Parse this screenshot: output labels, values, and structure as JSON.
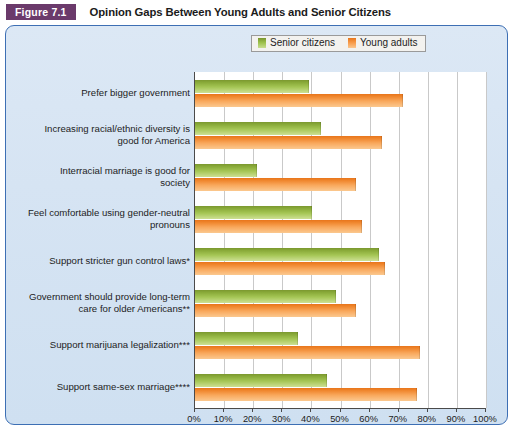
{
  "figure": {
    "tag": "Figure 7.1",
    "title": "Opinion Gaps Between Young Adults and Senior Citizens"
  },
  "legend": {
    "position": "top-center",
    "items": [
      {
        "label": "Senior citizens",
        "color": "#9cc04a",
        "icon": "legend-swatch-senior"
      },
      {
        "label": "Young adults",
        "color": "#f79a48",
        "icon": "legend-swatch-young"
      }
    ]
  },
  "axis": {
    "x_ticks": [
      "0%",
      "10%",
      "20%",
      "30%",
      "40%",
      "50%",
      "60%",
      "70%",
      "80%",
      "90%",
      "100%"
    ],
    "x_min": 0,
    "x_max": 100
  },
  "chart_data": {
    "type": "bar",
    "orientation": "horizontal",
    "title": "Opinion Gaps Between Young Adults and Senior Citizens",
    "xlabel": "",
    "ylabel": "",
    "xlim": [
      0,
      100
    ],
    "grid": true,
    "legend_position": "top-center",
    "categories": [
      "Prefer bigger government",
      "Increasing racial/ethnic diversity is good for America",
      "Interracial marriage is good for society",
      "Feel comfortable using gender-neutral pronouns",
      "Support stricter gun control laws*",
      "Government should provide long-term care for older Americans**",
      "Support marijuana legalization***",
      "Support same-sex marriage****"
    ],
    "category_lines": [
      [
        "Prefer bigger government"
      ],
      [
        "Increasing racial/ethnic diversity is",
        "good for America"
      ],
      [
        "Interracial marriage is good for",
        "society"
      ],
      [
        "Feel comfortable using gender-neutral",
        "pronouns"
      ],
      [
        "Support stricter gun control laws*"
      ],
      [
        "Government should provide long-term",
        "care for older Americans**"
      ],
      [
        "Support marijuana legalization***"
      ],
      [
        "Support same-sex marriage****"
      ]
    ],
    "series": [
      {
        "name": "Senior citizens",
        "color": "#9cc04a",
        "values": [
          39,
          43,
          21,
          40,
          63,
          48,
          35,
          45
        ]
      },
      {
        "name": "Young adults",
        "color": "#f79a48",
        "values": [
          71,
          64,
          55,
          57,
          65,
          55,
          77,
          76
        ]
      }
    ]
  },
  "colors": {
    "panel_border": "#3d6fb4",
    "panel_background": "#d6e4f3",
    "plot_background": "#ffffff",
    "tag_background": "#6b3a6b",
    "gridline": "#c9c9c9",
    "axis": "#4a4a4a"
  }
}
